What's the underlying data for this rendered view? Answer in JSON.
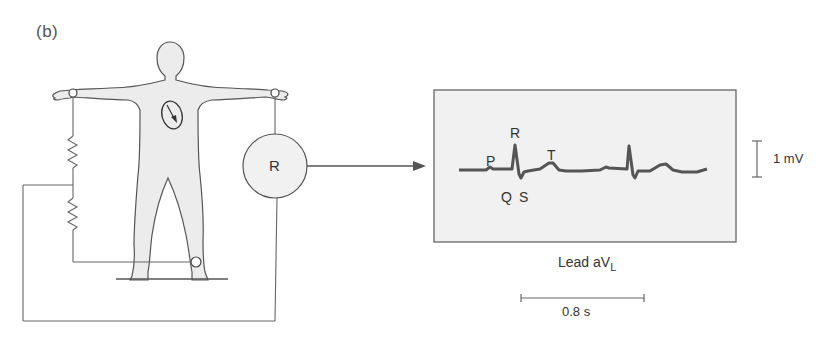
{
  "figure": {
    "panel_label": "(b)",
    "recorder_label": "R",
    "wave_labels": {
      "p": "P",
      "r": "R",
      "t": "T",
      "q": "Q",
      "s": "S"
    },
    "lead": {
      "prefix": "Lead aV",
      "subscript": "L"
    },
    "voltage_scale": "1 mV",
    "time_scale": "0.8 s",
    "colors": {
      "line": "#555555",
      "body_fill": "#ececec",
      "trace": "#555555",
      "box_fill": "#f1f1f1",
      "box_border": "#666666"
    }
  }
}
